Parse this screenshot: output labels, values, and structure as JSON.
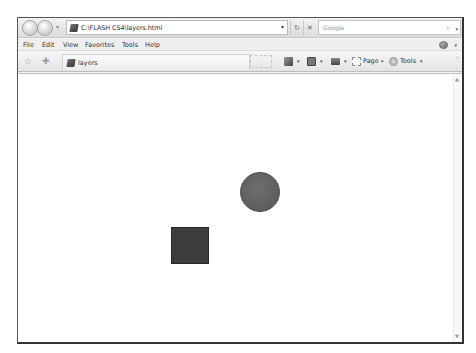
{
  "browser": {
    "address_url": "C:\\FLASH CS4\\layers.html",
    "search_placeholder": "Google",
    "icons": {
      "back": "back-arrow-icon",
      "forward": "forward-arrow-icon",
      "refresh": "↻",
      "stop": "✕",
      "search": "⌕",
      "dropdown": "▾",
      "favorites_star": "☆",
      "add_favorite": "✚"
    }
  },
  "menubar": {
    "items": [
      "File",
      "Edit",
      "View",
      "Favorites",
      "Tools",
      "Help"
    ]
  },
  "toolbar": {
    "tab_label": "layers",
    "page_label": "Page",
    "tools_label": "Tools",
    "chevron": "»"
  },
  "content": {
    "shapes": [
      {
        "type": "circle",
        "color": "#626262",
        "cx": 259,
        "cy": 190,
        "r": 20
      },
      {
        "type": "square",
        "color": "#3c3c3c",
        "x": 171,
        "y": 225,
        "w": 38,
        "h": 37
      }
    ]
  },
  "scrollbar": {
    "up": "▲",
    "down": "▼"
  }
}
